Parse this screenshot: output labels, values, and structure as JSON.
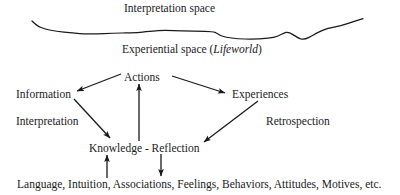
{
  "diagram": {
    "title_region": {
      "interpretation_space": "Interpretation space",
      "experiential_space_prefix": "Experiential space (",
      "experiential_space_emphasis": "Lifeworld",
      "experiential_space_suffix": ")"
    },
    "nodes": {
      "actions": "Actions",
      "information": "Information",
      "experiences": "Experiences",
      "interpretation": "Interpretation",
      "retrospection": "Retrospection",
      "knowledge_reflection": "Knowledge - Reflection",
      "foundations": "Language, Intuition, Associations, Feelings, Behaviors, Attitudes, Motives, etc."
    },
    "arrows": [
      {
        "name": "actions-to-information",
        "from": "Actions",
        "to": "Information",
        "direction": "down-left"
      },
      {
        "name": "actions-to-experiences",
        "from": "Actions",
        "to": "Experiences",
        "direction": "down-right"
      },
      {
        "name": "information-to-knowledge",
        "from": "Information",
        "to": "Knowledge - Reflection",
        "direction": "down-right",
        "label": "Interpretation"
      },
      {
        "name": "experiences-to-knowledge",
        "from": "Experiences",
        "to": "Knowledge - Reflection",
        "direction": "down-left",
        "label": "Retrospection"
      },
      {
        "name": "knowledge-to-actions",
        "from": "Knowledge - Reflection",
        "to": "Actions",
        "direction": "up"
      },
      {
        "name": "foundations-to-knowledge",
        "from": "Language, Intuition, Associations, Feelings, Behaviors, Attitudes, Motives, etc.",
        "to": "Knowledge",
        "direction": "up"
      },
      {
        "name": "reflection-to-foundations",
        "from": "Reflection",
        "to": "Language, Intuition, Associations, Feelings, Behaviors, Attitudes, Motives, etc.",
        "direction": "down"
      }
    ],
    "boundary": {
      "name": "wavy-boundary-line",
      "description": "hand-drawn horizontal wavy line separating interpretation space from experiential space"
    },
    "colors": {
      "background": "#ffffff",
      "ink": "#1a1a1a"
    }
  }
}
